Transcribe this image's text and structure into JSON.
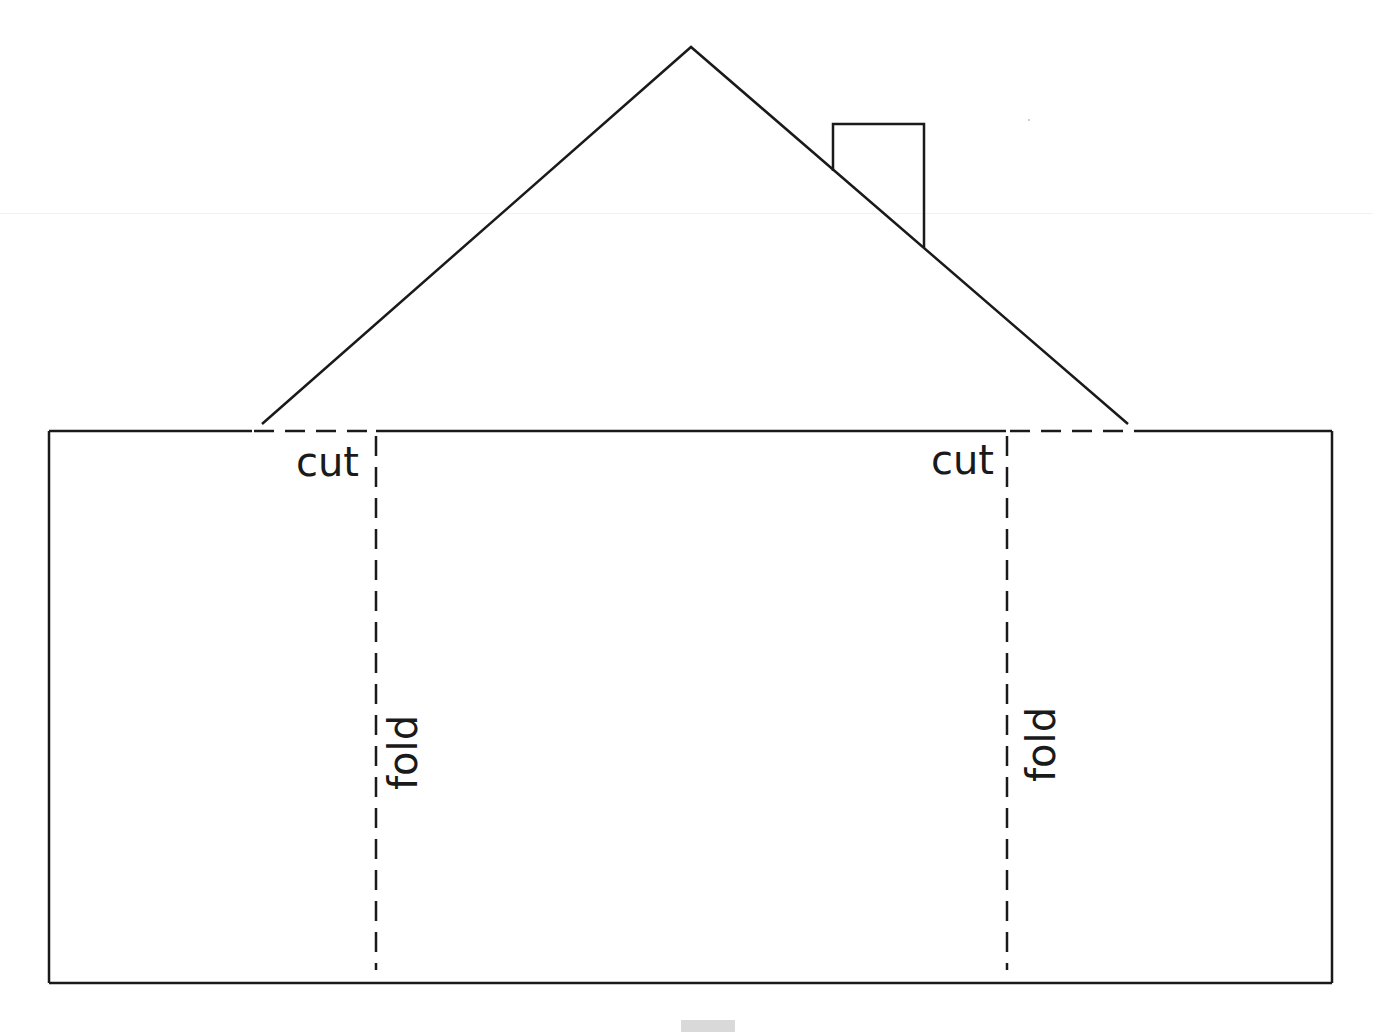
{
  "diagram": {
    "colors": {
      "stroke": "#1a1a1a",
      "background": "#ffffff",
      "marker": "#d9d9d9"
    },
    "labels": {
      "cut_left": "cut",
      "cut_right": "cut",
      "fold_left": "fold",
      "fold_right": "fold"
    },
    "shapes": {
      "base_rectangle": {
        "x1": 49,
        "y1": 431,
        "x2": 1332,
        "y2": 983
      },
      "roof": {
        "left": [
          262,
          424
        ],
        "apex": [
          691,
          47
        ],
        "right": [
          1128,
          424
        ]
      },
      "chimney": {
        "x_left": 833,
        "x_right": 924,
        "top": 124
      },
      "cut_lines": [
        {
          "from": [
            252,
            431
          ],
          "to": [
            376,
            431
          ],
          "style": "dashed"
        },
        {
          "from": [
            1006,
            431
          ],
          "to": [
            1140,
            431
          ],
          "style": "dashed"
        }
      ],
      "fold_lines": [
        {
          "x": 376,
          "from_y": 431,
          "to_y": 970,
          "style": "dashed"
        },
        {
          "x": 1007,
          "from_y": 431,
          "to_y": 970,
          "style": "dashed"
        }
      ]
    }
  }
}
